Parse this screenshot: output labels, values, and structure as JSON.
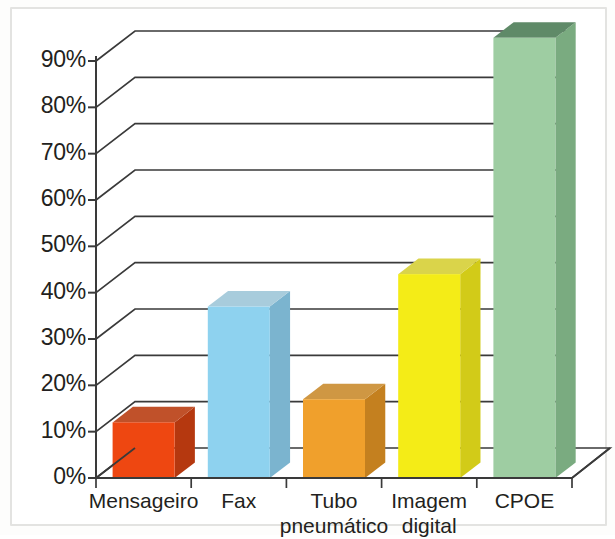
{
  "chart_data": {
    "type": "bar",
    "title": "",
    "subtitle": "",
    "xlabel": "",
    "ylabel": "",
    "categories": [
      "Mensageiro",
      "Fax",
      "Tubo pneumático",
      "Imagem digital",
      "CPOE"
    ],
    "values": [
      12,
      37,
      17,
      44,
      95
    ],
    "value_labels": [
      "12%",
      "37%",
      "17%",
      "44%",
      "95%"
    ],
    "series": [
      {
        "name": "",
        "values": [
          12,
          37,
          17,
          44,
          95
        ]
      }
    ],
    "ylim": [
      0,
      95
    ],
    "ytick_values": [
      0,
      10,
      20,
      30,
      40,
      50,
      60,
      70,
      80,
      90
    ],
    "ytick_labels": [
      "0%",
      "10%",
      "20%",
      "30%",
      "40%",
      "50%",
      "60%",
      "70%",
      "80%",
      "90%"
    ],
    "grid": true,
    "grid_axis": "y",
    "legend": false,
    "legend_position": "none",
    "style": "3d-column",
    "bar_colors": [
      "#ee4711",
      "#8ed2ef",
      "#f0a02c",
      "#f4ec17",
      "#9ecda2"
    ],
    "bar_side_colors": [
      "#b5380f",
      "#7bb4cf",
      "#c4801f",
      "#d2cb18",
      "#7aab80"
    ],
    "bar_top_colors": [
      "#c0512a",
      "#a8ccdc",
      "#cf9743",
      "#dad44a",
      "#5f8a68"
    ],
    "axis_color": "#3a3a3a",
    "grid_color": "#3a3a3a",
    "background": "#ffffff",
    "frame_color": "#e3e3e1"
  },
  "figure": {
    "frame_label": "chart-border",
    "axis_label": "3d-axis"
  }
}
